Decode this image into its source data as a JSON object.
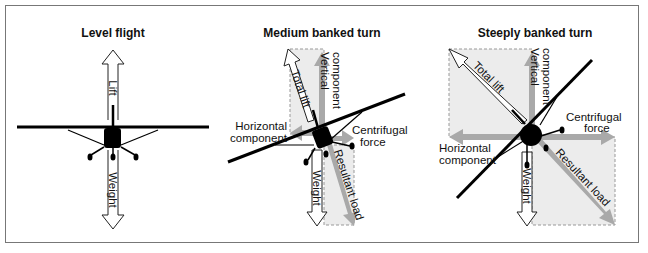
{
  "panels": [
    {
      "title": "Level flight",
      "labels": {
        "lift": "Lift",
        "weight": "Weight"
      }
    },
    {
      "title": "Medium banked turn",
      "labels": {
        "total_lift": "Total lift",
        "vertical": [
          "Vertical",
          "component"
        ],
        "horizontal": [
          "Horizontal",
          "component"
        ],
        "centrifugal": [
          "Centrifugal",
          "force"
        ],
        "weight": "Weight",
        "resultant": "Resultant load"
      }
    },
    {
      "title": "Steeply banked turn",
      "labels": {
        "total_lift": "Total lift",
        "vertical": [
          "Vertical",
          "component"
        ],
        "horizontal": [
          "Horizontal",
          "component"
        ],
        "centrifugal": [
          "Centrifugal",
          "force"
        ],
        "weight": "Weight",
        "resultant": "Resultant load"
      }
    }
  ],
  "colors": {
    "component_arrow": "#a9a9a9",
    "shaded_area": "#ececec",
    "aircraft": "#000000",
    "frame": "#777777"
  }
}
